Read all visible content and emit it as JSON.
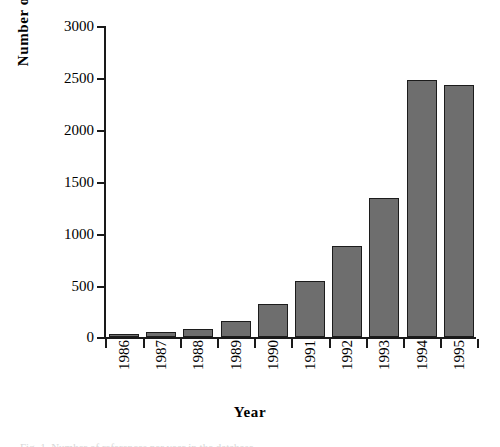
{
  "chart_data": {
    "type": "bar",
    "title": "",
    "xlabel": "Year",
    "ylabel": "Number  of  references",
    "categories": [
      "1986",
      "1987",
      "1988",
      "1989",
      "1990",
      "1991",
      "1992",
      "1993",
      "1994",
      "1995"
    ],
    "values": [
      15,
      50,
      80,
      155,
      320,
      540,
      880,
      1340,
      2480,
      2430
    ],
    "ylim": [
      0,
      3000
    ],
    "y_ticks": [
      0,
      500,
      1000,
      1500,
      2000,
      2500,
      3000
    ],
    "y_tick_labels": [
      "0",
      "500",
      "1000",
      "1500",
      "2000",
      "2500",
      "3000"
    ],
    "grid": false,
    "legend": false,
    "bar_color": "#6e6e6e",
    "bar_edge_color": "#1c1c1c",
    "axis_color": "#1a1a1a",
    "background": "#ffffff"
  },
  "figure": {
    "y_axis_title": "Number  of  references",
    "x_axis_title": "Year",
    "caption_cut": "Fig. 1.  Number of references per year in the database."
  }
}
